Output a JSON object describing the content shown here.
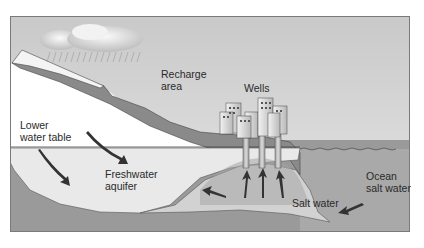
{
  "diagram": {
    "type": "saltwater-intrusion-cross-section",
    "labels": {
      "recharge_area": "Recharge\narea",
      "wells": "Wells",
      "lower_water_table": "Lower\nwater table",
      "freshwater_aquifer": "Freshwater\naquifer",
      "salt_water": "Salt water",
      "ocean_salt_water": "Ocean\nsalt water"
    },
    "colors": {
      "sky": "#d4d4d4",
      "land_surface": "#ffffff",
      "soil": "#8c8c8c",
      "bedrock": "#9a9a9a",
      "freshwater": "#e8e8e8",
      "saltwater_wedge": "#c4c4c4",
      "ocean": "#a8a8a8",
      "arrow": "#333333",
      "outline": "#444444"
    },
    "icons": [
      "cloud-icon",
      "rain-icon",
      "city-buildings-icon",
      "well-pipe-icon",
      "flow-arrow-icon"
    ]
  }
}
